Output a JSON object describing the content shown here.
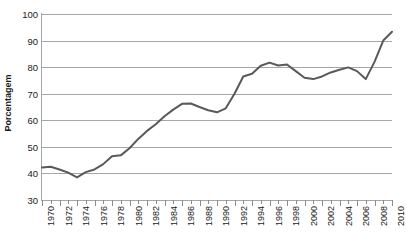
{
  "chart_data": {
    "type": "line",
    "title": "",
    "subtitle": "",
    "xlabel": "",
    "ylabel": "Porcentagem",
    "ylim": [
      30,
      100
    ],
    "xlim": [
      1970,
      2010
    ],
    "ytick_step": 10,
    "yticks": [
      100,
      90,
      80,
      70,
      60,
      50,
      40,
      30
    ],
    "xticks": [
      1970,
      1972,
      1974,
      1976,
      1978,
      1980,
      1982,
      1984,
      1986,
      1988,
      1990,
      1992,
      1994,
      1996,
      1998,
      2000,
      2002,
      2004,
      2006,
      2008,
      2010
    ],
    "xtick_minor_step": 1,
    "xtick_label_step": 2,
    "grid": "horizontal",
    "legend": "none",
    "line_color": "#595959",
    "grid_color": "#a6a6a6",
    "axis_color": "#a6a6a6",
    "background": "#ffffff",
    "line_width": 2,
    "markers": "none",
    "series": [
      {
        "name": "Porcentagem",
        "x": [
          1970,
          1971,
          1972,
          1973,
          1974,
          1975,
          1976,
          1977,
          1978,
          1979,
          1980,
          1981,
          1982,
          1983,
          1984,
          1985,
          1986,
          1987,
          1988,
          1989,
          1990,
          1991,
          1992,
          1993,
          1994,
          1995,
          1996,
          1997,
          1998,
          1999,
          2000,
          2001,
          2002,
          2003,
          2004,
          2005,
          2006,
          2007,
          2008,
          2009,
          2010
        ],
        "values": [
          42.2,
          42.5,
          41.5,
          40.3,
          38.5,
          40.5,
          41.5,
          43.5,
          46.5,
          46.8,
          49.5,
          53.0,
          56.0,
          58.5,
          61.5,
          64.0,
          66.2,
          66.3,
          65.0,
          63.8,
          63.0,
          64.5,
          70.0,
          76.5,
          77.5,
          80.5,
          81.7,
          80.6,
          81.0,
          78.5,
          76.0,
          75.5,
          76.5,
          78.0,
          79.0,
          79.9,
          78.5,
          75.5,
          82.0,
          90.0,
          93.3
        ]
      }
    ]
  }
}
